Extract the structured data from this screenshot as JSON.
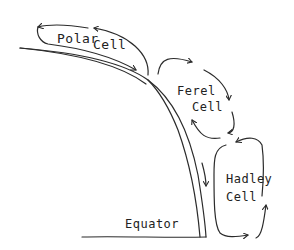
{
  "diagram": {
    "type": "atmospheric-circulation-cells",
    "style": "hand-drawn",
    "colors": {
      "ink": "#2b2b2b",
      "background": "#ffffff"
    },
    "labels": {
      "polar_word1": "Polar",
      "polar_word2": "Cell",
      "ferrel_word1": "Ferel",
      "ferrel_word2": "Cell",
      "hadley_word1": "Hadley",
      "hadley_word2": "Cell",
      "equator": "Equator"
    },
    "cells": [
      {
        "name": "Polar Cell",
        "position": "top-left"
      },
      {
        "name": "Ferel Cell",
        "position": "middle"
      },
      {
        "name": "Hadley Cell",
        "position": "bottom-right"
      }
    ]
  }
}
